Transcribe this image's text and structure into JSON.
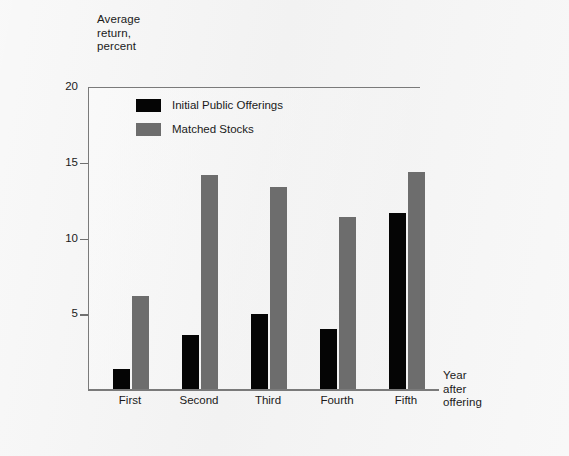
{
  "figure": {
    "y_axis_title": "Average\nreturn,\npercent",
    "x_axis_title": "Year\nafter\noffering"
  },
  "legend": {
    "items": [
      {
        "label": "Initial Public Offerings",
        "color": "#050505",
        "key": "ipo"
      },
      {
        "label": "Matched Stocks",
        "color": "#6d6d6d",
        "key": "matched"
      }
    ]
  },
  "chart_data": {
    "type": "bar",
    "title": "",
    "subtitle": "",
    "xlabel": "Year after offering",
    "ylabel": "Average return, percent",
    "categories": [
      "First",
      "Second",
      "Third",
      "Fourth",
      "Fifth"
    ],
    "series": [
      {
        "name": "Initial Public Offerings",
        "color": "#050505",
        "values": [
          1.4,
          3.6,
          5.0,
          4.0,
          11.7
        ]
      },
      {
        "name": "Matched Stocks",
        "color": "#6d6d6d",
        "values": [
          6.2,
          14.2,
          13.4,
          11.4,
          14.4
        ]
      }
    ],
    "ylim": [
      0,
      20
    ],
    "yticks": [
      5,
      10,
      15,
      20
    ],
    "ytick_labels": [
      "5",
      "10",
      "15",
      "20"
    ],
    "grid": false,
    "legend_position": "top-left-inside"
  }
}
